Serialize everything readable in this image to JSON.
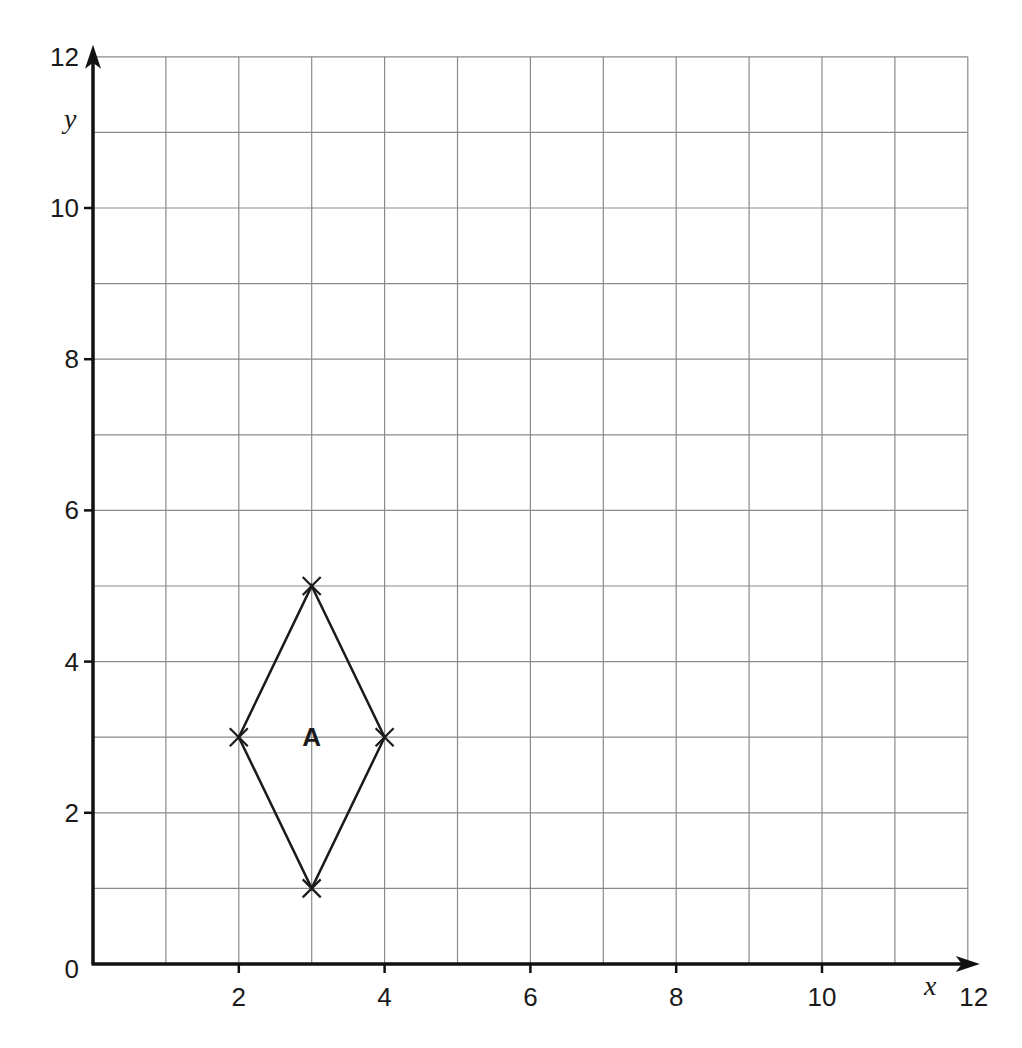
{
  "chart_data": {
    "type": "scatter",
    "title": "",
    "xlabel": "x",
    "ylabel": "y",
    "xlim": [
      0,
      12
    ],
    "ylim": [
      0,
      12
    ],
    "grid": true,
    "grid_step": 1,
    "x_ticks": [
      2,
      4,
      6,
      8,
      10,
      12
    ],
    "y_ticks": [
      0,
      2,
      4,
      6,
      8,
      10,
      12
    ],
    "x_tick_labels": [
      "2",
      "4",
      "6",
      "8",
      "10",
      "12"
    ],
    "y_tick_labels": [
      "0",
      "2",
      "4",
      "6",
      "8",
      "10",
      "12"
    ],
    "shapes": [
      {
        "name": "A",
        "kind": "rhombus",
        "vertices": [
          [
            3,
            5
          ],
          [
            4,
            3
          ],
          [
            3,
            1
          ],
          [
            2,
            3
          ]
        ],
        "label_position": [
          3,
          3
        ],
        "vertex_marker": "x"
      }
    ],
    "legend": null
  },
  "colors": {
    "axis": "#111111",
    "grid": "#8a8a8a",
    "shape": "#1a1a1a",
    "background": "#ffffff"
  }
}
